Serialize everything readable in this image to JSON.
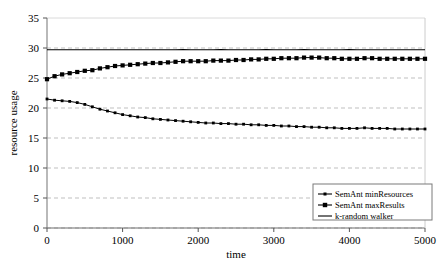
{
  "chart_data": {
    "type": "line",
    "title": "",
    "xlabel": "time",
    "ylabel": "resource usage",
    "xlim": [
      0,
      5000
    ],
    "ylim": [
      0,
      35
    ],
    "xticks": [
      0,
      1000,
      2000,
      3000,
      4000,
      5000
    ],
    "yticks": [
      0,
      5,
      10,
      15,
      20,
      25,
      30,
      35
    ],
    "grid": "horizontal-dashed",
    "legend_position": "bottom-right",
    "x": [
      0,
      100,
      200,
      300,
      400,
      500,
      600,
      700,
      800,
      900,
      1000,
      1100,
      1200,
      1300,
      1400,
      1500,
      1600,
      1700,
      1800,
      1900,
      2000,
      2100,
      2200,
      2300,
      2400,
      2500,
      2600,
      2700,
      2800,
      2900,
      3000,
      3100,
      3200,
      3300,
      3400,
      3500,
      3600,
      3700,
      3800,
      3900,
      4000,
      4100,
      4200,
      4300,
      4400,
      4500,
      4600,
      4700,
      4800,
      4900,
      5000
    ],
    "series": [
      {
        "name": "SemAnt minResources",
        "marker": "small-square",
        "values": [
          21.5,
          21.3,
          21.2,
          21.1,
          20.9,
          20.6,
          20.2,
          19.8,
          19.5,
          19.2,
          18.9,
          18.7,
          18.5,
          18.4,
          18.2,
          18.1,
          18.0,
          17.9,
          17.8,
          17.7,
          17.6,
          17.5,
          17.5,
          17.4,
          17.4,
          17.3,
          17.3,
          17.2,
          17.2,
          17.1,
          17.1,
          17.0,
          17.0,
          16.9,
          16.9,
          16.8,
          16.8,
          16.7,
          16.7,
          16.6,
          16.6,
          16.6,
          16.7,
          16.6,
          16.6,
          16.6,
          16.5,
          16.5,
          16.5,
          16.5,
          16.5
        ]
      },
      {
        "name": "SemAnt maxResults",
        "marker": "large-square",
        "values": [
          24.8,
          25.3,
          25.6,
          25.8,
          26.0,
          26.2,
          26.3,
          26.6,
          26.8,
          27.0,
          27.1,
          27.2,
          27.3,
          27.4,
          27.5,
          27.5,
          27.6,
          27.7,
          27.8,
          27.8,
          27.8,
          27.8,
          27.9,
          27.9,
          27.9,
          28.0,
          28.0,
          28.1,
          28.1,
          28.2,
          28.2,
          28.3,
          28.3,
          28.3,
          28.4,
          28.4,
          28.4,
          28.3,
          28.3,
          28.2,
          28.2,
          28.2,
          28.3,
          28.3,
          28.2,
          28.2,
          28.2,
          28.2,
          28.2,
          28.2,
          28.2
        ]
      },
      {
        "name": "k-random walker",
        "marker": "none",
        "values": [
          29.7,
          29.7,
          29.7,
          29.7,
          29.7,
          29.7,
          29.7,
          29.7,
          29.7,
          29.7,
          29.7,
          29.7,
          29.7,
          29.7,
          29.7,
          29.7,
          29.7,
          29.7,
          29.75,
          29.7,
          29.7,
          29.7,
          29.7,
          29.75,
          29.7,
          29.7,
          29.7,
          29.7,
          29.7,
          29.75,
          29.7,
          29.7,
          29.7,
          29.7,
          29.75,
          29.7,
          29.7,
          29.7,
          29.7,
          29.7,
          29.75,
          29.7,
          29.7,
          29.7,
          29.7,
          29.7,
          29.7,
          29.7,
          29.7,
          29.7,
          29.7
        ]
      }
    ]
  },
  "axes": {
    "ytick_labels": [
      "0",
      "5",
      "10",
      "15",
      "20",
      "25",
      "30",
      "35"
    ],
    "xtick_labels": [
      "0",
      "1000",
      "2000",
      "3000",
      "4000",
      "5000"
    ],
    "x_axis_title": "time",
    "y_axis_title": "resource usage"
  },
  "legend": {
    "entries": [
      {
        "label": "SemAnt minResources",
        "marker": "small-square"
      },
      {
        "label": "SemAnt maxResults",
        "marker": "large-square"
      },
      {
        "label": "k-random walker",
        "marker": "line"
      }
    ]
  },
  "colors": {
    "series": "#000000",
    "grid": "#b8b8b8",
    "axis": "#808080",
    "background": "#ffffff",
    "legend_border": "#7a7a7a"
  }
}
